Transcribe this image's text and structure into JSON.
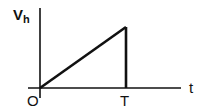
{
  "diagram": {
    "type": "waveform",
    "title": "",
    "y_axis": {
      "label_main": "V",
      "label_sub": "h"
    },
    "x_axis": {
      "label": "t"
    },
    "origin_label": "O",
    "period_label": "T",
    "waveform": {
      "shape": "ramp",
      "points": [
        {
          "t": 0,
          "v": 0
        },
        {
          "t": "T",
          "v": "max"
        },
        {
          "t": "T",
          "v": 0
        }
      ]
    },
    "colors": {
      "line": "#111111",
      "background": "#ffffff"
    }
  }
}
